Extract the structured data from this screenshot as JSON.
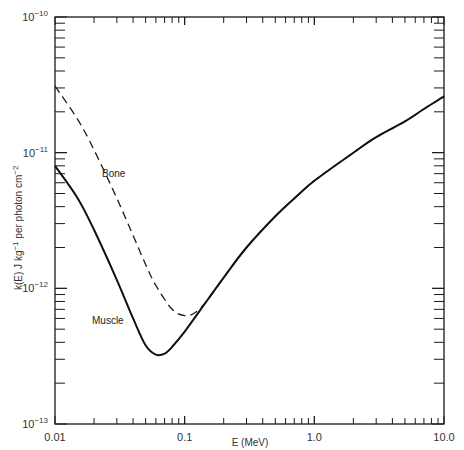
{
  "chart_data": {
    "type": "line",
    "title": "",
    "xlabel": "E  (MeV)",
    "ylabel": "k(E)  J kg⁻¹  per photon cm⁻²",
    "xscale": "log",
    "yscale": "log",
    "xlim": [
      0.01,
      10.0
    ],
    "ylim": [
      1e-13,
      1e-10
    ],
    "x_ticks": [
      "0.01",
      "0.1",
      "1.0",
      "10.0"
    ],
    "y_ticks": [
      {
        "base": "10",
        "exp": "−10"
      },
      {
        "base": "10",
        "exp": "−11"
      },
      {
        "base": "10",
        "exp": "−12"
      },
      {
        "base": "10",
        "exp": "−13"
      }
    ],
    "grid": false,
    "legend": "inline labels",
    "series": [
      {
        "name": "Muscle",
        "style": "solid",
        "x": [
          0.01,
          0.015,
          0.02,
          0.03,
          0.04,
          0.05,
          0.06,
          0.07,
          0.08,
          0.1,
          0.15,
          0.2,
          0.3,
          0.5,
          0.7,
          1.0,
          2.0,
          3.0,
          5.0,
          7.0,
          10.0
        ],
        "values": [
          8e-12,
          4.6e-12,
          2.7e-12,
          1.15e-12,
          6e-13,
          3.8e-13,
          3.25e-13,
          3.3e-13,
          3.7e-13,
          4.8e-13,
          8.2e-13,
          1.2e-12,
          2e-12,
          3.4e-12,
          4.6e-12,
          6.2e-12,
          1e-11,
          1.3e-11,
          1.7e-11,
          2.1e-11,
          2.6e-11
        ]
      },
      {
        "name": "Bone",
        "style": "dashed",
        "x": [
          0.01,
          0.015,
          0.02,
          0.03,
          0.04,
          0.05,
          0.06,
          0.08,
          0.1,
          0.12,
          0.15,
          0.2,
          0.3,
          0.5,
          0.7,
          1.0,
          2.0,
          3.0,
          5.0,
          7.0,
          10.0
        ],
        "values": [
          3.1e-11,
          1.75e-11,
          1.05e-11,
          4.6e-12,
          2.45e-12,
          1.5e-12,
          1.05e-12,
          7e-13,
          6.3e-13,
          6.6e-13,
          8.2e-13,
          1.2e-12,
          2e-12,
          3.4e-12,
          4.6e-12,
          6.2e-12,
          1e-11,
          1.3e-11,
          1.7e-11,
          2.1e-11,
          2.6e-11
        ]
      }
    ],
    "annotations": [
      {
        "text": "Bone",
        "near_x": 0.022,
        "near_y": 9e-12
      },
      {
        "text": "Muscle",
        "near_x": 0.016,
        "near_y": 5e-13
      }
    ]
  },
  "labels": {
    "bone": "Bone",
    "muscle": "Muscle",
    "xlabel": "E  (MeV)",
    "ylabel_main": "k(E)  J kg",
    "ylabel_exp1": "−1",
    "ylabel_mid": "  per photon  cm",
    "ylabel_exp2": "−2"
  }
}
